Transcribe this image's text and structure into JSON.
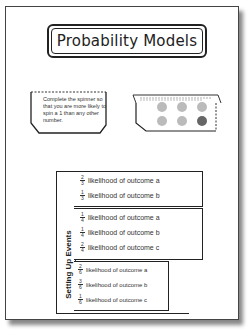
{
  "title": "Probability Models",
  "spinner_card": {
    "text": "Complete the spinner so that you are more likely to spin a 1 than any other number."
  },
  "dice_card": {
    "circles": [
      "#bbbbbb",
      "#bbbbbb",
      "#bbbbbb",
      "#bbbbbb",
      "#bbbbbb",
      "#666666"
    ]
  },
  "events_tab": {
    "label": "Setting Up Events",
    "sections": [
      {
        "rows": [
          {
            "num": "2",
            "den": "3",
            "text": "likelihood of outcome a"
          },
          {
            "num": "1",
            "den": "3",
            "text": "likelihood of outcome b"
          }
        ]
      },
      {
        "rows": [
          {
            "num": "1",
            "den": "4",
            "text": "likelihood of outcome a"
          },
          {
            "num": "1",
            "den": "4",
            "text": "likelihood of outcome b"
          },
          {
            "num": "2",
            "den": "4",
            "text": "likelihood of outcome c"
          }
        ]
      },
      {
        "rows": [
          {
            "num": "2",
            "den": "6",
            "text": "likelihood of outcome a"
          },
          {
            "num": "3",
            "den": "6",
            "text": "likelihood of outcome b"
          },
          {
            "num": "1",
            "den": "6",
            "text": "likelihood of outcome c"
          }
        ]
      }
    ]
  },
  "faded_text": {
    "line1": "n sides:",
    "line2": "3, 3, 3"
  }
}
